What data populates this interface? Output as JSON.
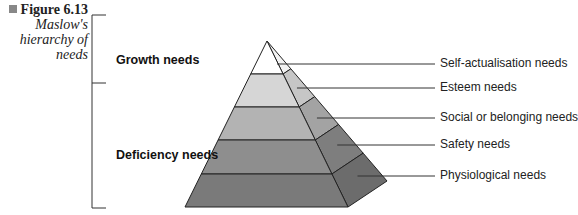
{
  "caption": {
    "figure_number": "Figure 6.13",
    "title_lines": [
      "Maslow's",
      "hierarchy of",
      "needs"
    ]
  },
  "groups": {
    "growth": "Growth needs",
    "deficiency": "Deficiency needs"
  },
  "levels": [
    {
      "label": "Self-actualisation needs",
      "fill": "#ffffff",
      "side": "#f2f2f2"
    },
    {
      "label": "Esteem needs",
      "fill": "#d6d6d6",
      "side": "#c6c6c6"
    },
    {
      "label": "Social or belonging needs",
      "fill": "#b3b3b3",
      "side": "#a3a3a3"
    },
    {
      "label": "Safety needs",
      "fill": "#8e8e8e",
      "side": "#7e7e7e"
    },
    {
      "label": "Physiological needs",
      "fill": "#7a7a7a",
      "side": "#6c6c6c"
    }
  ]
}
